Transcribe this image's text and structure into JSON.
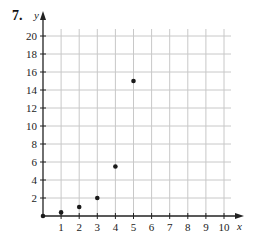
{
  "problem_number": "7.",
  "chart_data": {
    "type": "scatter",
    "title": "",
    "xlabel": "x",
    "ylabel": "y",
    "x": [
      0,
      1,
      2,
      3,
      4,
      5
    ],
    "y": [
      0,
      0.4,
      1,
      2,
      5.5,
      15
    ],
    "xlim": [
      0,
      10
    ],
    "ylim": [
      0,
      20
    ],
    "x_ticks": [
      1,
      2,
      3,
      4,
      5,
      6,
      7,
      8,
      9,
      10
    ],
    "y_ticks": [
      2,
      4,
      6,
      8,
      10,
      12,
      14,
      16,
      18,
      20
    ],
    "grid": true,
    "legend": null
  },
  "colors": {
    "grid": "#c8c8c8",
    "axis": "#222222",
    "point": "#1a1a1a",
    "text": "#222222"
  }
}
